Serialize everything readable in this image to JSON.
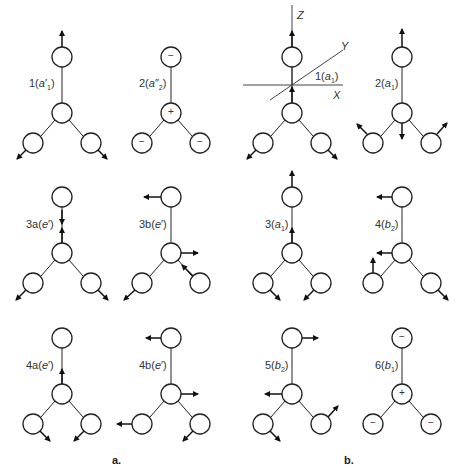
{
  "panels": [
    {
      "caption": "a.",
      "modes": [
        "1(a'1)",
        "2(a''2)",
        "3a(e')",
        "3b(e')",
        "4a(e')",
        "4b(e')"
      ]
    },
    {
      "caption": "b.",
      "modes": [
        "1(a1)",
        "2(a1)",
        "3(a1)",
        "4(b2)",
        "5(b2)",
        "6(b1)"
      ]
    }
  ],
  "labels": {
    "m1": {
      "num": "1(",
      "sym": "a",
      "sup": "′",
      "sub": "1",
      "end": ")"
    },
    "m2": {
      "num": "2(",
      "sym": "a",
      "sup": "″",
      "sub": "2",
      "end": ")"
    },
    "m3": {
      "num": "1(",
      "sym": "a",
      "sub": "1",
      "end": ")"
    },
    "m4": {
      "num": "2(",
      "sym": "a",
      "sub": "1",
      "end": ")"
    },
    "m5": {
      "num": "3a(",
      "sym": "e",
      "sup": "′",
      "end": ")"
    },
    "m6": {
      "num": "3b(",
      "sym": "e",
      "sup": "′",
      "end": ")"
    },
    "m7": {
      "num": "3(",
      "sym": "a",
      "sub": "1",
      "end": ")"
    },
    "m8": {
      "num": "4(",
      "sym": "b",
      "sub": "2",
      "end": ")"
    },
    "m9": {
      "num": "4a(",
      "sym": "e",
      "sup": "′",
      "end": ")"
    },
    "m10": {
      "num": "4b(",
      "sym": "e",
      "sup": "′",
      "end": ")"
    },
    "m11": {
      "num": "5(",
      "sym": "b",
      "sub": "2",
      "end": ")"
    },
    "m12": {
      "num": "6(",
      "sym": "b",
      "sub": "1",
      "end": ")"
    }
  },
  "axes": {
    "z": "Z",
    "y": "Y",
    "x": "X"
  },
  "signs": {
    "plus": "+",
    "minus": "−"
  },
  "captions": {
    "a": "a.",
    "b": "b."
  }
}
